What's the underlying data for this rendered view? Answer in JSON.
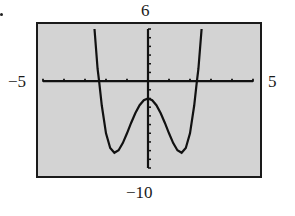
{
  "window": {
    "xmin_label": "−5",
    "xmax_label": "5",
    "ymax_label": "6",
    "ymin_label": "−10"
  },
  "colors": {
    "background": "#d3d3d3",
    "frame": "#1a1a1a",
    "curve": "#111111",
    "axes": "#111111"
  },
  "chart_data": {
    "type": "line",
    "title": "",
    "xlabel": "",
    "ylabel": "",
    "xlim": [
      -5,
      5
    ],
    "ylim": [
      -10,
      6
    ],
    "xscale_tick": 1,
    "yscale_tick": 1,
    "grid": false,
    "legend": null,
    "tick_labels": {
      "x_min": "−5",
      "x_max": "5",
      "y_min": "−10",
      "y_max": "6"
    },
    "series": [
      {
        "name": "f(x)",
        "description": "Quartic curve with W shape: local max near (0, -2), local minima near (±1.6, -8.25), x-intercepts near ±2.3",
        "x": [
          -2.55,
          -2.4,
          -2.33,
          -2.2,
          -2.0,
          -1.8,
          -1.6,
          -1.4,
          -1.2,
          -1.0,
          -0.8,
          -0.6,
          -0.4,
          -0.2,
          0.0,
          0.2,
          0.4,
          0.6,
          0.8,
          1.0,
          1.2,
          1.4,
          1.6,
          1.8,
          2.0,
          2.2,
          2.33,
          2.4,
          2.55
        ],
        "y": [
          6.0,
          1.4,
          0.0,
          -2.8,
          -6.0,
          -7.7,
          -8.25,
          -7.96,
          -7.13,
          -6.0,
          -4.79,
          -3.67,
          -2.77,
          -2.2,
          -2.0,
          -2.2,
          -2.77,
          -3.67,
          -4.79,
          -6.0,
          -7.13,
          -7.96,
          -8.25,
          -7.7,
          -6.0,
          -2.8,
          0.0,
          1.4,
          6.0
        ]
      }
    ],
    "key_points": {
      "local_max": [
        0,
        -2
      ],
      "local_min_left": [
        -1.58,
        -8.25
      ],
      "local_min_right": [
        1.58,
        -8.25
      ],
      "x_intercepts": [
        -2.32,
        2.32
      ]
    }
  }
}
